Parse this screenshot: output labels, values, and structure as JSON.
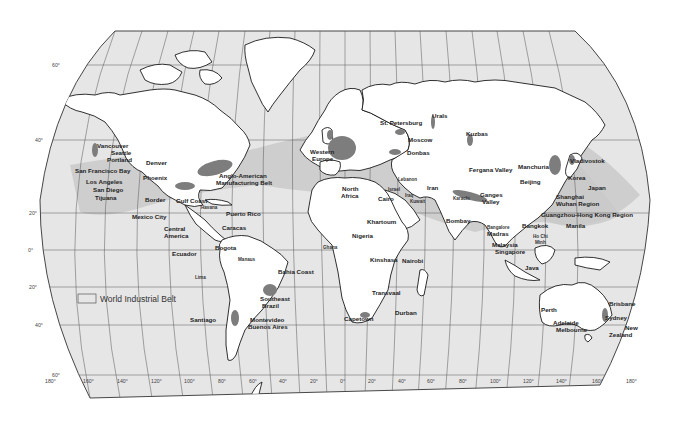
{
  "map": {
    "title": "World Industrial Belt",
    "projection": "Robinson-style world map",
    "colors": {
      "ocean": "#e6e6e6",
      "land": "#ffffff",
      "belt": "#c9c9c9",
      "industrial_core": "#7d7d7d",
      "outline": "#1a1a1a"
    }
  },
  "legend": {
    "swatch_label": "World Industrial Belt"
  },
  "latitude_labels": [
    "60°",
    "40°",
    "20°",
    "0°",
    "20°",
    "40°",
    "60°"
  ],
  "longitude_labels": [
    "180°",
    "160°",
    "140°",
    "120°",
    "100°",
    "80°",
    "60°",
    "40°",
    "20°",
    "0°",
    "20°",
    "40°",
    "60°",
    "80°",
    "100°",
    "120°",
    "140°",
    "160°",
    "180°"
  ],
  "regions": {
    "north_america": {
      "vancouver": "Vancouver",
      "seattle": "Seattle",
      "portland": "Portland",
      "sf_bay": "San Francisco Bay",
      "los_angeles": "Los Angeles",
      "san_diego": "San Diego",
      "tijuana": "Tijuana",
      "denver": "Denver",
      "phoenix": "Phoenix",
      "border": "Border",
      "gulf_coast": "Gulf Coast",
      "anglo_american_1": "Anglo-American",
      "anglo_american_2": "Manufacturing Belt",
      "havana": "Havana",
      "puerto_rico": "Puerto Rico",
      "mexico_city": "Mexico City",
      "central_america_1": "Central",
      "central_america_2": "America"
    },
    "south_america": {
      "caracas": "Caracas",
      "bogota": "Bogota",
      "ecuador": "Ecuador",
      "manaus": "Manaus",
      "lima": "Lima",
      "bahia_coast": "Bahia Coast",
      "southeast_brazil_1": "Southeast",
      "southeast_brazil_2": "Brazil",
      "santiago": "Santiago",
      "montevideo": "Montevideo",
      "buenos_aires": "Buenos Aires"
    },
    "europe": {
      "st_petersburg": "St. Petersburg",
      "urals": "Urals",
      "moscow": "Moscow",
      "donbas": "Donbas",
      "western_europe_1": "Western",
      "western_europe_2": "Europe",
      "kuzbas": "Kuzbas"
    },
    "africa_middle_east": {
      "north_africa_1": "North",
      "north_africa_2": "Africa",
      "lebanon": "Lebanon",
      "israel": "Israel",
      "iraq": "Iraq",
      "cairo": "Cairo",
      "kuwait": "Kuwait",
      "iran": "Iran",
      "khartoum": "Khartoum",
      "nigeria": "Nigeria",
      "ghana": "Ghana",
      "kinshasa": "Kinshasa",
      "nairobi": "Nairobi",
      "transvaal": "Transvaal",
      "durban": "Durban",
      "capetown": "Capetown"
    },
    "asia": {
      "fergana_valley": "Fergana Valley",
      "karachi": "Karachi",
      "ganges_1": "Ganges",
      "ganges_2": "Valley",
      "bombay": "Bombay",
      "bangalore": "Bangalore",
      "madras": "Madras",
      "manchuria": "Manchuria",
      "vladivostok": "Vladivostok",
      "beijing": "Beijing",
      "korea": "Korea",
      "japan": "Japan",
      "shanghai": "Shanghai",
      "wuhan": "Wuhan Region",
      "guangzhou": "Guangzhou-Hong Kong Region",
      "bangkok": "Bangkok",
      "manila": "Manila",
      "ho_chi_minh_1": "Ho Chi",
      "ho_chi_minh_2": "Minh",
      "malaysia": "Malaysia",
      "singapore": "Singapore",
      "java": "Java"
    },
    "oceania": {
      "perth": "Perth",
      "brisbane": "Brisbane",
      "sydney": "Sydney",
      "adelaide": "Adelaide",
      "melbourne": "Melbourne",
      "new_zealand_1": "New",
      "new_zealand_2": "Zealand"
    }
  }
}
